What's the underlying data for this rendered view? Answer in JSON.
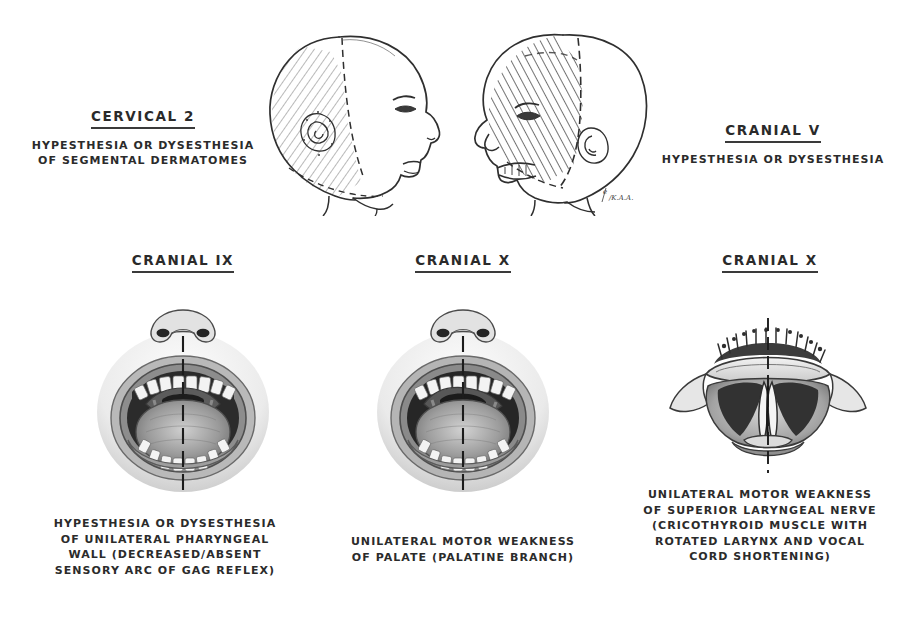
{
  "figure": {
    "background_color": "#ffffff",
    "ink_color": "#2b2b2b",
    "width": 923,
    "height": 622
  },
  "panels": [
    {
      "id": "cervical-2",
      "heading": "CERVICAL 2",
      "caption_lines": [
        "HYPESTHESIA OR DYSESTHESIA",
        "OF SEGMENTAL DERMATOMES"
      ],
      "illustration": "right-facing-head-profile-occipital-hatching",
      "illustration_notes": "Lateral head profile facing right; diagonal line hatching over posterior scalp and occipital region bounded by a dashed line marking the C2 dermatome; small stippled ear."
    },
    {
      "id": "cranial-v",
      "heading": "CRANIAL V",
      "caption_lines": [
        "HYPESTHESIA OR DYSESTHESIA"
      ],
      "illustration": "left-facing-head-profile-trigeminal-hatching",
      "illustration_notes": "Lateral head profile facing left; heavy diagonal hatching across face, forehead and anterior scalp in the trigeminal nerve distribution; dashed boundary lines; artist signature near the neck."
    },
    {
      "id": "cranial-ix",
      "heading": "CRANIAL IX",
      "caption_lines": [
        "HYPESTHESIA OR DYSESTHESIA",
        "OF UNILATERAL PHARYNGEAL",
        "WALL (DECREASED/ABSENT",
        "SENSORY ARC OF GAG REFLEX)"
      ],
      "illustration": "open-mouth-oropharynx",
      "illustration_notes": "Frontal view of open mouth showing nose, upper and lower teeth, tongue, uvula, palatine arches and posterior pharyngeal wall, bisected by a vertical dashed midline."
    },
    {
      "id": "cranial-x-palate",
      "heading": "CRANIAL X",
      "caption_lines": [
        "UNILATERAL MOTOR WEAKNESS",
        "OF PALATE (PALATINE BRANCH)"
      ],
      "illustration": "open-mouth-deviated-palate",
      "illustration_notes": "Frontal view of open mouth with soft palate and uvula deviating to one side, bisected by a vertical dashed midline."
    },
    {
      "id": "cranial-x-larynx",
      "heading": "CRANIAL X",
      "caption_lines": [
        "UNILATERAL MOTOR WEAKNESS",
        "OF SUPERIOR LARYNGEAL NERVE",
        "(CRICOTHYROID MUSCLE WITH",
        "ROTATED LARYNX AND VOCAL",
        "CORD SHORTENING)"
      ],
      "illustration": "laryngoscopic-vocal-cords",
      "illustration_notes": "Laryngoscopic mirror view of the larynx showing epiglottis, aryepiglottic folds and paired vocal cords forming a narrow glottic slit, bisected by a vertical dashed midline."
    }
  ],
  "signature": "K.A.A."
}
